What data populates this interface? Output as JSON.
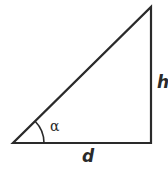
{
  "diagram": {
    "type": "right-triangle",
    "stroke_color": "#2a2a2a",
    "background": "#ffffff",
    "vertices": {
      "bottom_left": [
        13,
        143
      ],
      "bottom_right": [
        151,
        143
      ],
      "top_right": [
        151,
        7
      ]
    },
    "labels": {
      "height": "h",
      "base": "d",
      "angle": "α"
    }
  }
}
